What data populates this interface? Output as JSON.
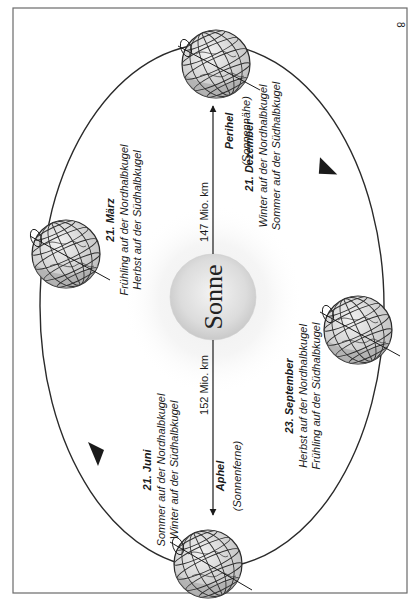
{
  "page": {
    "page_number": "8"
  },
  "sun": {
    "label": "Sonne"
  },
  "distances": {
    "perihel": {
      "value": "147 Mio. km",
      "title": "Perihel",
      "subtitle": "(Sonnennähe)"
    },
    "aphel": {
      "value": "152 Mio. km",
      "title": "Aphel",
      "subtitle": "(Sonnenferne)"
    }
  },
  "seasons": [
    {
      "date": "21. März",
      "line1": "Frühling auf der Nordhalbkugel",
      "line2": "Herbst auf der Südhalbkugel"
    },
    {
      "date": "21. Juni",
      "line1": "Sommer auf der Nordhalbkugel",
      "line2": "Winter auf der Südhalbkugel"
    },
    {
      "date": "23. September",
      "line1": "Herbst auf der Nordhalbkugel",
      "line2": "Frühling auf der Südhalbkugel"
    },
    {
      "date": "21. Dezember",
      "line1": "Winter auf der Nordhalbkugel",
      "line2": "Sommer auf der Südhalbkugel"
    }
  ],
  "colors": {
    "frame": "#6a6a6a",
    "orbit": "#2a2a2a",
    "sun_fill": "#d9d9d9",
    "sun_glow": "#f0f0f0",
    "globe_light": "#e6e6e6",
    "globe_dark": "#a8a8a8",
    "text": "#1a1a1a"
  }
}
